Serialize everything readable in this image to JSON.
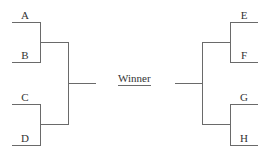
{
  "diagram": {
    "type": "tournament-bracket",
    "center_label": "Winner",
    "left_teams": [
      "A",
      "B",
      "C",
      "D"
    ],
    "right_teams": [
      "E",
      "F",
      "G",
      "H"
    ],
    "line_color": "#6a6a6a",
    "text_color": "#333333"
  }
}
